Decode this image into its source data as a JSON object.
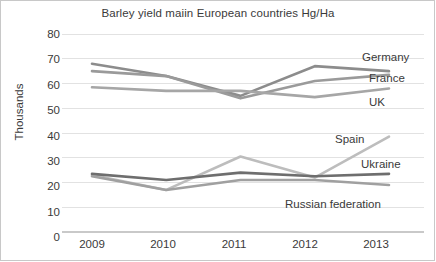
{
  "chart_data": {
    "type": "line",
    "title": "Barley yield maiin European countries Hg/Ha",
    "xlabel": "",
    "ylabel": "Thousands",
    "categories": [
      "2009",
      "2010",
      "2011",
      "2012",
      "2013"
    ],
    "x": [
      2009,
      2010,
      2011,
      2012,
      2013
    ],
    "ylim": [
      0,
      80
    ],
    "yticks": [
      "0",
      "10",
      "20",
      "30",
      "40",
      "50",
      "60",
      "70",
      "80"
    ],
    "ytick_values": [
      0,
      10,
      20,
      30,
      40,
      50,
      60,
      70,
      80
    ],
    "grid": "horizontal",
    "legend_position": "line-end-labels",
    "series": [
      {
        "name": "Germany",
        "values": [
          68.0,
          63.0,
          55.0,
          67.0,
          65.0
        ],
        "color": "#8c8c8c"
      },
      {
        "name": "France",
        "values": [
          65.0,
          63.0,
          54.0,
          61.0,
          63.5
        ],
        "color": "#9a9a9a"
      },
      {
        "name": "UK",
        "values": [
          58.5,
          57.0,
          57.0,
          54.5,
          58.0
        ],
        "color": "#a6a6a6"
      },
      {
        "name": "Spain",
        "values": [
          23.0,
          17.0,
          30.5,
          22.0,
          38.5
        ],
        "color": "#bdbdbd"
      },
      {
        "name": "Ukraine",
        "values": [
          23.5,
          21.0,
          24.0,
          22.5,
          23.5
        ],
        "color": "#6e6e6e"
      },
      {
        "name": "Russian federation",
        "values": [
          22.5,
          17.0,
          21.0,
          21.0,
          19.0
        ],
        "color": "#a0a0a0"
      }
    ],
    "annotations": [
      {
        "text": "Germany",
        "series": "Germany"
      },
      {
        "text": "France",
        "series": "France"
      },
      {
        "text": "UK",
        "series": "UK"
      },
      {
        "text": "Spain",
        "series": "Spain"
      },
      {
        "text": "Ukraine",
        "series": "Ukraine"
      },
      {
        "text": "Russian federation",
        "series": "Russian federation"
      }
    ],
    "colors": {
      "grid": "#e2e2e2",
      "axis": "#d0d0d0",
      "text": "#3a3a3a",
      "background": "#ffffff"
    }
  }
}
